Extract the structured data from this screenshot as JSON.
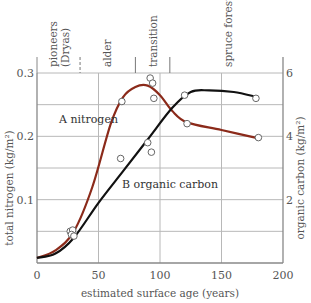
{
  "chart_data": {
    "type": "line",
    "title": "",
    "xlabel": "estimated surface age (years)",
    "ylabel": "total nitrogen (kg/m²)",
    "ylabel_right": "organic carbon (kg/m²)",
    "xlim": [
      0,
      200
    ],
    "ylim": [
      0,
      0.3
    ],
    "ylim_right": [
      0,
      6
    ],
    "x_ticks": [
      "0",
      "50",
      "100",
      "150",
      "200"
    ],
    "y_ticks": [
      "0.1",
      "0.2",
      "0.3"
    ],
    "y_ticks_right": [
      "2",
      "4",
      "6"
    ],
    "grid": true,
    "stages": [
      {
        "label": "pioneers (Dryas)",
        "x_start": 0,
        "x_end": 35
      },
      {
        "label": "alder",
        "x_start": 35,
        "x_end": 80
      },
      {
        "label": "transition",
        "x_start": 80,
        "x_end": 108
      },
      {
        "label": "spruce forest",
        "x_start": 108,
        "x_end": 200
      }
    ],
    "series": [
      {
        "name": "A nitrogen",
        "axis": "left",
        "color": "#8b2a1a",
        "points": [
          [
            27,
            0.05
          ],
          [
            29,
            0.052
          ],
          [
            28,
            0.045
          ],
          [
            69,
            0.255
          ],
          [
            92,
            0.292
          ],
          [
            94,
            0.284
          ],
          [
            95,
            0.26
          ],
          [
            122,
            0.22
          ],
          [
            180,
            0.198
          ]
        ],
        "curve": [
          [
            0,
            0.008
          ],
          [
            15,
            0.02
          ],
          [
            30,
            0.05
          ],
          [
            45,
            0.12
          ],
          [
            60,
            0.22
          ],
          [
            70,
            0.262
          ],
          [
            80,
            0.278
          ],
          [
            90,
            0.28
          ],
          [
            100,
            0.265
          ],
          [
            110,
            0.24
          ],
          [
            122,
            0.222
          ],
          [
            150,
            0.21
          ],
          [
            182,
            0.196
          ]
        ]
      },
      {
        "name": "B organic carbon",
        "axis": "right",
        "color": "#111111",
        "points": [
          [
            30,
            0.85
          ],
          [
            68,
            3.3
          ],
          [
            90,
            3.8
          ],
          [
            93,
            3.5
          ],
          [
            120,
            5.3
          ],
          [
            178,
            5.2
          ]
        ],
        "curve": [
          [
            0,
            0.16
          ],
          [
            15,
            0.3
          ],
          [
            30,
            0.8
          ],
          [
            50,
            1.9
          ],
          [
            70,
            2.9
          ],
          [
            90,
            3.9
          ],
          [
            110,
            4.9
          ],
          [
            125,
            5.4
          ],
          [
            140,
            5.45
          ],
          [
            160,
            5.4
          ],
          [
            178,
            5.25
          ]
        ]
      }
    ]
  },
  "labels": {
    "series_a": "A   nitrogen",
    "series_b": "B   organic carbon"
  }
}
